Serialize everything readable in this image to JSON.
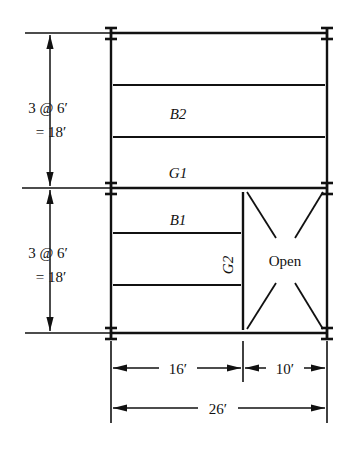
{
  "diagram": {
    "type": "structural-framing-plan",
    "title": "",
    "members": {
      "beam_upper_label": "B2",
      "beam_lower_label": "B1",
      "girder_horizontal_label": "G1",
      "girder_vertical_label": "G2",
      "opening_label": "Open"
    },
    "dimensions": {
      "vertical_upper_line1": "3 @ 6′",
      "vertical_upper_line2": "= 18′",
      "vertical_lower_line1": "3 @ 6′",
      "vertical_lower_line2": "= 18′",
      "horizontal_left": "16′",
      "horizontal_right": "10′",
      "horizontal_total": "26′"
    },
    "colors": {
      "line": "#111111",
      "background": "#ffffff"
    },
    "grid": {
      "bay_width_left_ft": 16,
      "bay_width_right_ft": 10,
      "bay_width_total_ft": 26,
      "bay_height_upper_ft": 18,
      "bay_height_lower_ft": 18,
      "spacing_note": "3 @ 6 ft"
    }
  }
}
